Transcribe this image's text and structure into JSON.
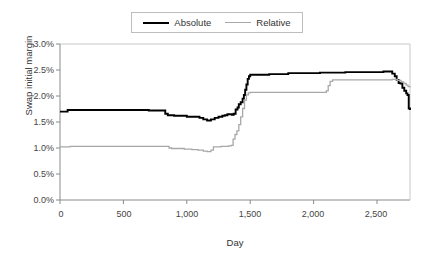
{
  "legend": {
    "position": "top-center",
    "entries": [
      {
        "label": "Absolute",
        "color": "#000000",
        "swatch": "line-swatch-absolute"
      },
      {
        "label": "Relative",
        "color": "#a8a8a8",
        "swatch": "line-swatch-relative"
      }
    ]
  },
  "axes": {
    "y_title": "Swap initial margin",
    "x_title": "Day",
    "y_ticks": [
      "0.0%",
      "0.5%",
      "1.0%",
      "1.5%",
      "2.0%",
      "2.5%",
      "3.0%"
    ],
    "x_ticks": [
      "0",
      "500",
      "1,000",
      "1,500",
      "2,000",
      "2,500"
    ]
  },
  "caption": {
    "text": ""
  },
  "chart_data": {
    "type": "line",
    "title": "",
    "xlabel": "Day",
    "ylabel": "Swap initial margin",
    "xlim": [
      0,
      2760
    ],
    "ylim": [
      0,
      3.0
    ],
    "y_unit": "percent",
    "y_tick_values": [
      0.0,
      0.5,
      1.0,
      1.5,
      2.0,
      2.5,
      3.0
    ],
    "x_tick_values": [
      0,
      500,
      1000,
      1500,
      2000,
      2500
    ],
    "grid": false,
    "legend_position": "top-center",
    "series": [
      {
        "name": "Absolute",
        "color": "#000000",
        "line_width": 1.9,
        "step_style": true,
        "x": [
          0,
          30,
          60,
          90,
          140,
          200,
          300,
          400,
          500,
          600,
          660,
          690,
          700,
          760,
          800,
          830,
          850,
          880,
          900,
          950,
          1000,
          1050,
          1100,
          1130,
          1160,
          1190,
          1220,
          1250,
          1280,
          1300,
          1320,
          1340,
          1355,
          1370,
          1385,
          1400,
          1410,
          1425,
          1440,
          1450,
          1460,
          1470,
          1480,
          1490,
          1500,
          1560,
          1650,
          1750,
          1800,
          1850,
          1950,
          2050,
          2150,
          2250,
          2350,
          2450,
          2550,
          2600,
          2620,
          2640,
          2655,
          2670,
          2685,
          2700,
          2715,
          2730,
          2740,
          2750,
          2760
        ],
        "y": [
          1.7,
          1.7,
          1.73,
          1.73,
          1.73,
          1.73,
          1.73,
          1.73,
          1.73,
          1.73,
          1.73,
          1.73,
          1.72,
          1.72,
          1.72,
          1.66,
          1.63,
          1.63,
          1.62,
          1.62,
          1.6,
          1.6,
          1.58,
          1.55,
          1.53,
          1.55,
          1.58,
          1.6,
          1.62,
          1.63,
          1.65,
          1.65,
          1.64,
          1.66,
          1.74,
          1.78,
          1.84,
          1.88,
          1.95,
          2.02,
          2.12,
          2.22,
          2.33,
          2.38,
          2.41,
          2.41,
          2.42,
          2.42,
          2.44,
          2.44,
          2.44,
          2.45,
          2.45,
          2.46,
          2.46,
          2.46,
          2.47,
          2.47,
          2.43,
          2.38,
          2.31,
          2.25,
          2.24,
          2.16,
          2.1,
          2.05,
          2.02,
          1.76,
          1.73
        ]
      },
      {
        "name": "Relative",
        "color": "#a8a8a8",
        "line_width": 1.3,
        "step_style": true,
        "x": [
          0,
          40,
          80,
          150,
          250,
          400,
          550,
          700,
          830,
          860,
          880,
          920,
          980,
          1040,
          1090,
          1130,
          1160,
          1190,
          1210,
          1240,
          1270,
          1300,
          1330,
          1350,
          1365,
          1380,
          1395,
          1410,
          1425,
          1440,
          1455,
          1470,
          1485,
          1500,
          1600,
          1750,
          1900,
          2000,
          2080,
          2100,
          2115,
          2130,
          2150,
          2250,
          2400,
          2550,
          2620,
          2660,
          2690,
          2710,
          2730,
          2745,
          2760
        ],
        "y": [
          1.02,
          1.02,
          1.03,
          1.03,
          1.03,
          1.03,
          1.03,
          1.03,
          1.03,
          1.0,
          0.99,
          0.99,
          0.98,
          0.97,
          0.96,
          0.94,
          0.93,
          0.96,
          1.02,
          1.02,
          1.03,
          1.03,
          1.04,
          1.05,
          1.17,
          1.26,
          1.33,
          1.45,
          1.6,
          1.76,
          1.92,
          2.02,
          2.06,
          2.07,
          2.07,
          2.07,
          2.07,
          2.07,
          2.07,
          2.1,
          2.2,
          2.28,
          2.31,
          2.31,
          2.31,
          2.31,
          2.32,
          2.3,
          2.27,
          2.24,
          2.21,
          2.18,
          2.17
        ]
      }
    ]
  }
}
